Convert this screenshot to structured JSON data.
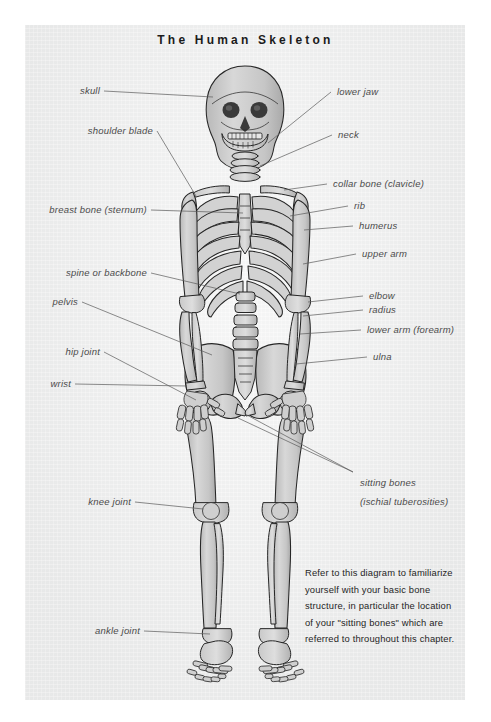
{
  "page": {
    "title": "The Human Skeleton",
    "background_color": "#ffffff",
    "panel_color": "#eceded",
    "label_color": "#4b4b4b",
    "leader_line_color": "#5a5a5a",
    "bone_fill_color": "#cfcfcf",
    "bone_outline_color": "#2b2b2b"
  },
  "labels_left": [
    {
      "text": "skull"
    },
    {
      "text": "shoulder blade"
    },
    {
      "text": "breast bone (sternum)"
    },
    {
      "text": "spine or backbone"
    },
    {
      "text": "pelvis"
    },
    {
      "text": "hip joint"
    },
    {
      "text": "wrist"
    },
    {
      "text": "knee joint"
    },
    {
      "text": "ankle joint"
    }
  ],
  "labels_right": [
    {
      "text": "lower jaw"
    },
    {
      "text": "neck"
    },
    {
      "text": "collar bone (clavicle)"
    },
    {
      "text": "rib"
    },
    {
      "text": "humerus"
    },
    {
      "text": "upper arm"
    },
    {
      "text": "elbow"
    },
    {
      "text": "radius"
    },
    {
      "text": "lower arm (forearm)"
    },
    {
      "text": "ulna"
    },
    {
      "text": "sitting bones"
    },
    {
      "text": "(ischial tuberosities)"
    }
  ],
  "caption": {
    "lines": [
      "Refer to this diagram to familiarize",
      "yourself with your basic bone",
      "structure, in particular the location",
      "of your \"sitting bones\" which are",
      "referred to throughout this chapter."
    ]
  }
}
